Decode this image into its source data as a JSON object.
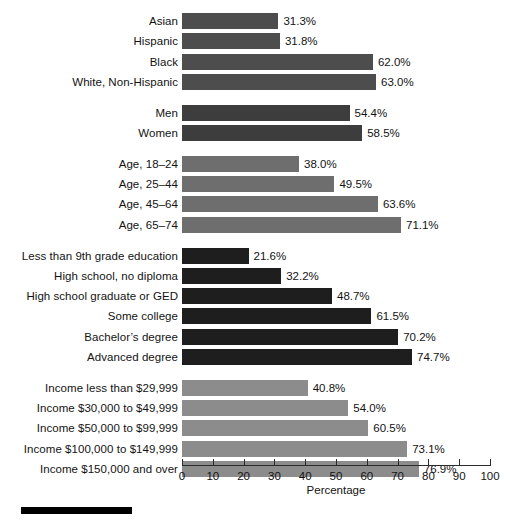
{
  "chart_data": {
    "type": "bar",
    "orientation": "horizontal",
    "title": "",
    "xlabel": "Percentage",
    "ylabel": "",
    "xlim": [
      0,
      100
    ],
    "grid": false,
    "legend": false,
    "xticks": [
      0,
      10,
      20,
      30,
      40,
      50,
      60,
      70,
      80,
      90,
      100
    ],
    "xticklabels": [
      "0",
      "10",
      "20",
      "30",
      "40",
      "50",
      "60",
      "70",
      "80",
      "90",
      "100"
    ],
    "value_suffix": "%",
    "groups": [
      {
        "name": "race-ethnicity",
        "color": "#4d4d4d",
        "categories": [
          "Asian",
          "Hispanic",
          "Black",
          "White, Non-Hispanic"
        ],
        "values": [
          31.3,
          31.8,
          62.0,
          63.0
        ],
        "value_labels": [
          "31.3%",
          "31.8%",
          "62.0%",
          "63.0%"
        ]
      },
      {
        "name": "gender",
        "color": "#3d3d3d",
        "categories": [
          "Men",
          "Women"
        ],
        "values": [
          54.4,
          58.5
        ],
        "value_labels": [
          "54.4%",
          "58.5%"
        ]
      },
      {
        "name": "age",
        "color": "#6e6e6e",
        "categories": [
          "Age, 18–24",
          "Age, 25–44",
          "Age, 45–64",
          "Age, 65–74"
        ],
        "values": [
          38.0,
          49.5,
          63.6,
          71.1
        ],
        "value_labels": [
          "38.0%",
          "49.5%",
          "63.6%",
          "71.1%"
        ]
      },
      {
        "name": "education",
        "color": "#1e1e1e",
        "categories": [
          "Less than 9th grade education",
          "High school, no diploma",
          "High school graduate or GED",
          "Some college",
          "Bachelor’s degree",
          "Advanced degree"
        ],
        "values": [
          21.6,
          32.2,
          48.7,
          61.5,
          70.2,
          74.7
        ],
        "value_labels": [
          "21.6%",
          "32.2%",
          "48.7%",
          "61.5%",
          "70.2%",
          "74.7%"
        ]
      },
      {
        "name": "income",
        "color": "#8c8c8c",
        "categories": [
          "Income less than $29,999",
          "Income $30,000 to $49,999",
          "Income $50,000 to $99,999",
          "Income $100,000 to $149,999",
          "Income $150,000 and over"
        ],
        "values": [
          40.8,
          54.0,
          60.5,
          73.1,
          76.9
        ],
        "value_labels": [
          "40.8%",
          "54.0%",
          "60.5%",
          "73.1%",
          "76.9%"
        ]
      }
    ]
  },
  "footer": {
    "rule_color": "#000000"
  }
}
